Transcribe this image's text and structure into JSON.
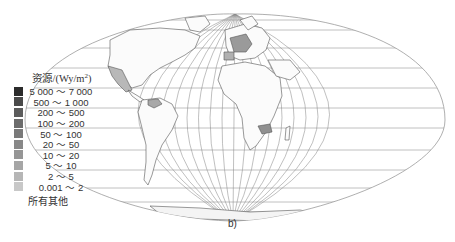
{
  "figure": {
    "caption": "b)",
    "projection": "elliptical world map with graticule"
  },
  "legend": {
    "title_prefix": "资源/(Wy/m",
    "title_sup": "2",
    "title_suffix": ")",
    "items": [
      {
        "label": "5 000 ～ 7 000",
        "color": "#2b2b2b"
      },
      {
        "label": "500 ～ 1 000",
        "color": "#4a4a4a"
      },
      {
        "label": "200 ～ 500",
        "color": "#5c5c5c"
      },
      {
        "label": "100 ～ 200",
        "color": "#6c6c6c"
      },
      {
        "label": "50 ～ 100",
        "color": "#7a7a7a"
      },
      {
        "label": "20 ～ 50",
        "color": "#888888"
      },
      {
        "label": "10 ～ 20",
        "color": "#969696"
      },
      {
        "label": "5 ～ 10",
        "color": "#a6a6a6"
      },
      {
        "label": "2 ～ 5",
        "color": "#b6b6b6"
      },
      {
        "label": "0.001 ～ 2",
        "color": "#c8c8c8"
      }
    ],
    "other_label": "所有其他"
  },
  "map": {
    "graticule_color": "#8a8a8a",
    "outline_color": "#555555",
    "highlighted_regions": [
      {
        "name": "Mexico",
        "shade": "#b8b8b8"
      },
      {
        "name": "Venezuela",
        "shade": "#a8a8a8"
      },
      {
        "name": "Western Europe",
        "shade": "#9a9a9a"
      },
      {
        "name": "Iberia",
        "shade": "#b0b0b0"
      },
      {
        "name": "Zambia",
        "shade": "#909090"
      }
    ]
  }
}
